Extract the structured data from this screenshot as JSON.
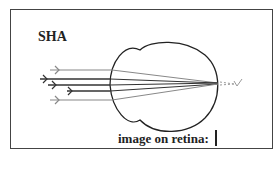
{
  "diagram": {
    "title": "SHA",
    "caption": "image on retina:",
    "rays": [
      {
        "name": "ray-1",
        "tone": "light"
      },
      {
        "name": "ray-2",
        "tone": "dark"
      },
      {
        "name": "ray-3",
        "tone": "dark"
      },
      {
        "name": "ray-4",
        "tone": "dark"
      },
      {
        "name": "ray-5",
        "tone": "light"
      }
    ],
    "colors": {
      "outline": "#222222",
      "ray_dark": "#333333",
      "ray_light": "#888888",
      "dashed": "#999999"
    }
  }
}
